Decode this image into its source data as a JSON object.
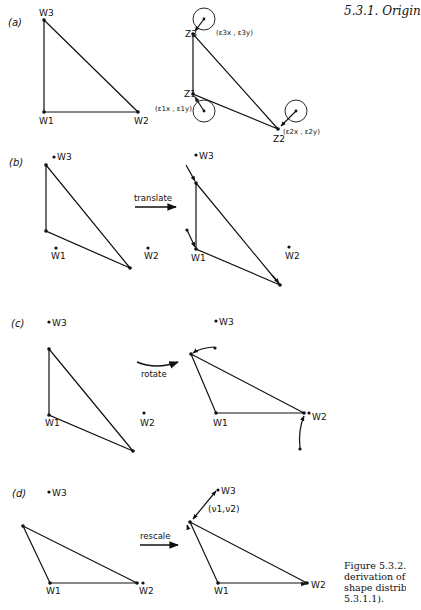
{
  "header": {
    "section_title": "5.3.1. Origin"
  },
  "caption": {
    "lines": [
      "Figure 5.3.2.",
      "derivation of",
      "shape distribu",
      "5.3.1.1)."
    ]
  },
  "panels": {
    "a": {
      "label": "(a)",
      "left": {
        "w3": "W3",
        "w1": "W1",
        "w2": "W2"
      },
      "right": {
        "z3": "Z3",
        "z1": "Z1",
        "z2": "Z2",
        "e3": "(ε3x , ε3y)",
        "e1": "(ε1x , ε1y)",
        "e2": "(ε2x , ε2y)"
      }
    },
    "b": {
      "label": "(b)",
      "operation": "translate",
      "left": {
        "w3": "W3",
        "w1": "W1",
        "w2": "W2"
      },
      "right": {
        "w3": "W3",
        "w1": "W1",
        "w2": "W2"
      }
    },
    "c": {
      "label": "(c)",
      "operation": "rotate",
      "left": {
        "w3": "W3",
        "w1": "W1",
        "w2": "W2"
      },
      "right": {
        "w3": "W3",
        "w1": "W1",
        "w2": "W2"
      }
    },
    "d": {
      "label": "(d)",
      "operation": "rescale",
      "left": {
        "w3": "W3",
        "w1": "W1",
        "w2": "W2"
      },
      "right": {
        "w3": "W3",
        "w1": "W1",
        "w2": "W2",
        "nu": "(ν1,ν2)"
      }
    }
  }
}
